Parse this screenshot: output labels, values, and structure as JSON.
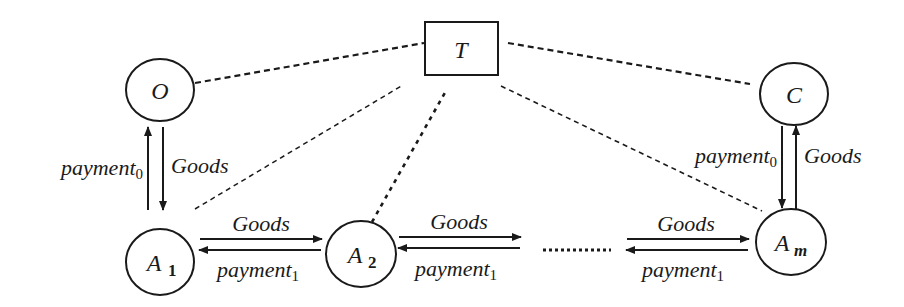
{
  "diagram": {
    "colors": {
      "stroke": "#1a1a1a",
      "background": "#ffffff"
    },
    "nodes": {
      "trusted": {
        "id": "T",
        "shape": "rectangle",
        "label": "T"
      },
      "origin": {
        "id": "O",
        "shape": "circle",
        "label": "O"
      },
      "customer": {
        "id": "C",
        "shape": "circle",
        "label": "C"
      },
      "agent1": {
        "id": "A1",
        "shape": "circle",
        "label": "A",
        "sub": "1"
      },
      "agent2": {
        "id": "A2",
        "shape": "circle",
        "label": "A",
        "sub": "2"
      },
      "agentm": {
        "id": "Am",
        "shape": "circle",
        "label": "A",
        "sub": "m"
      }
    },
    "edges": {
      "o_a1_payment": {
        "label": "payment",
        "sub": "0",
        "from": "A1",
        "to": "O"
      },
      "o_a1_goods": {
        "label": "Goods",
        "from": "O",
        "to": "A1"
      },
      "c_am_payment": {
        "label": "payment",
        "sub": "0",
        "from": "C",
        "to": "Am"
      },
      "c_am_goods": {
        "label": "Goods",
        "from": "Am",
        "to": "C"
      },
      "a1_a2_goods": {
        "label": "Goods",
        "from": "A1",
        "to": "A2"
      },
      "a1_a2_payment": {
        "label": "payment",
        "sub": "1",
        "from": "A2",
        "to": "A1"
      },
      "a2_next_goods": {
        "label": "Goods",
        "from": "A2",
        "to": "..."
      },
      "a2_next_payment": {
        "label": "payment",
        "sub": "1",
        "from": "...",
        "to": "A2"
      },
      "prev_am_goods": {
        "label": "Goods",
        "from": "...",
        "to": "Am"
      },
      "prev_am_payment": {
        "label": "payment",
        "sub": "1",
        "from": "Am",
        "to": "..."
      }
    },
    "dashed_links": [
      "T-O",
      "T-C",
      "T-A1",
      "T-A2",
      "T-Am"
    ],
    "ellipsis": "........"
  }
}
